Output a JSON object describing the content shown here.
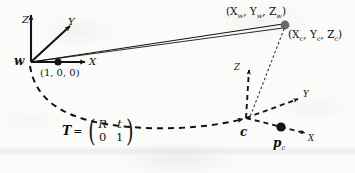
{
  "figure": {
    "type": "coordinate-frame-transformation-diagram",
    "caption": "",
    "ink_color": "#141414",
    "paper_color": "#fbfbfa"
  },
  "world_frame": {
    "origin_label": "w",
    "axes": [
      {
        "name": "Z",
        "label": "Z",
        "direction": "up"
      },
      {
        "name": "Y",
        "label": "Y",
        "direction": "up-right-diagonal"
      },
      {
        "name": "X",
        "label": "X",
        "direction": "right"
      }
    ],
    "marked_point": {
      "label": "(1, 0, 0)",
      "on_axis": "X"
    }
  },
  "camera_frame": {
    "origin_label": "c",
    "axes": [
      {
        "name": "Z",
        "label": "Z",
        "direction": "up"
      },
      {
        "name": "Y",
        "label": "Y",
        "direction": "up-right-diagonal"
      },
      {
        "name": "X",
        "label": "X",
        "direction": "down-right"
      }
    ],
    "marked_point": {
      "label": "p",
      "subscript": "c"
    }
  },
  "scene_point": {
    "world_coords_label": "(X",
    "world_sub1": "w",
    "world_mid1": ", Y",
    "world_sub2": "w",
    "world_mid2": ", Z",
    "world_sub3": "w",
    "world_end": ")",
    "camera_coords_label": "(X",
    "cam_sub1": "c",
    "cam_mid1": ", Y",
    "cam_sub2": "c",
    "cam_mid2": ", Z",
    "cam_sub3": "c",
    "cam_end": ")"
  },
  "transform": {
    "symbol": "T",
    "equals": "=",
    "left_paren": "(",
    "right_paren": ")",
    "m00": "R",
    "m01": "t",
    "m10": "0",
    "m11": "1"
  }
}
